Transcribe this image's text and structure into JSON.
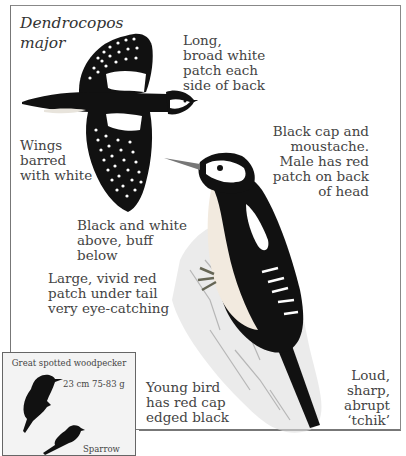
{
  "page": {
    "species_latin": "Dendrocopos\nmajor",
    "annotations": {
      "back_patch": "Long,\nbroad white\npatch each\nside of back",
      "head": "Black cap and\nmoustache.\nMale has red\npatch on back\nof head",
      "wings": "Wings\nbarred\nwith white",
      "plumage": "Black and white\nabove, buff\nbelow",
      "undertail": "Large, vivid red\npatch under tail\nvery eye-catching",
      "young": "Young bird\nhas red cap\nedged black",
      "call": "Loud,\nsharp,\nabrupt\n‘tchik’"
    },
    "size_inset": {
      "title": "Great spotted woodpecker",
      "measurements": "23 cm  75-83 g",
      "comparison_label": "Sparrow"
    },
    "colors": {
      "frame": "#777777",
      "text": "#444444",
      "inset_bg": "#f3f3f3",
      "plumage_black": "#111111"
    }
  }
}
